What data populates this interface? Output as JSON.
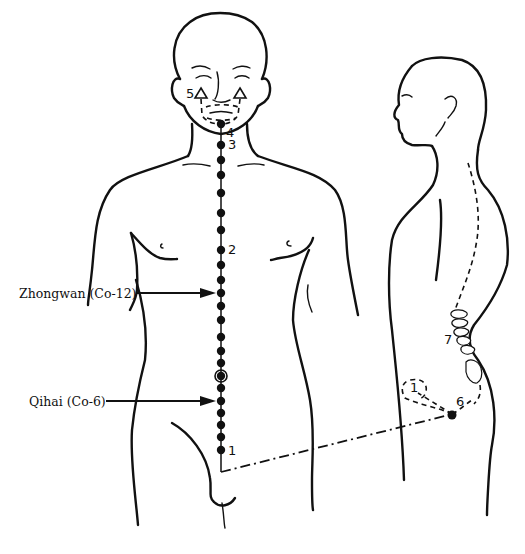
{
  "figure": {
    "callouts": [
      {
        "id": "zhongwan",
        "label": "Zhongwan (Co-12)"
      },
      {
        "id": "qihai",
        "label": "Qihai (Co-6)"
      }
    ],
    "front_numbers": [
      {
        "id": "n1",
        "text": "1"
      },
      {
        "id": "n2",
        "text": "2"
      },
      {
        "id": "n3",
        "text": "3"
      },
      {
        "id": "n4",
        "text": "4"
      },
      {
        "id": "n5",
        "text": "5"
      }
    ],
    "side_numbers": [
      {
        "id": "s1",
        "text": "1"
      },
      {
        "id": "s6",
        "text": "6"
      },
      {
        "id": "s7",
        "text": "7"
      }
    ],
    "meridian_point_count": 24,
    "colors": {
      "ink": "#111111",
      "paper": "#ffffff"
    }
  }
}
